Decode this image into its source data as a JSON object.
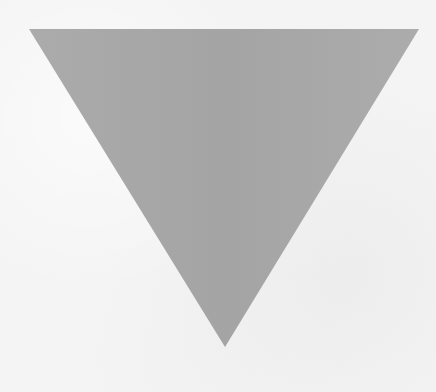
{
  "canvas": {
    "width": 436,
    "height": 392,
    "background": "#f4f4f4"
  },
  "shape": {
    "type": "inverted-triangle",
    "fill": "#a8a8a8",
    "points": [
      [
        29,
        29
      ],
      [
        419,
        29
      ],
      [
        225,
        347
      ]
    ]
  }
}
